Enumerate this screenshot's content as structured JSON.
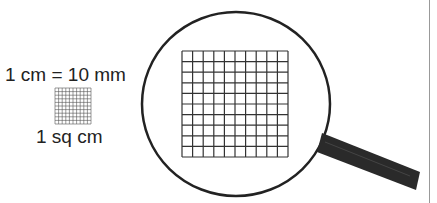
{
  "diagram": {
    "equation_label": "1 cm = 10 mm",
    "area_label": "1 sq cm",
    "small_grid": {
      "rows": 10,
      "cols": 10,
      "x": 55,
      "y": 88,
      "size": 36,
      "color": "#555555"
    },
    "magnified_grid": {
      "rows": 10,
      "cols": 10,
      "x": 182,
      "y": 51,
      "size": 106,
      "color": "#333333"
    },
    "magnifier": {
      "cx": 236,
      "cy": 104,
      "rx": 94,
      "ry": 92,
      "lens_color": "#222222",
      "handle_color": "#2a2a2a"
    }
  }
}
